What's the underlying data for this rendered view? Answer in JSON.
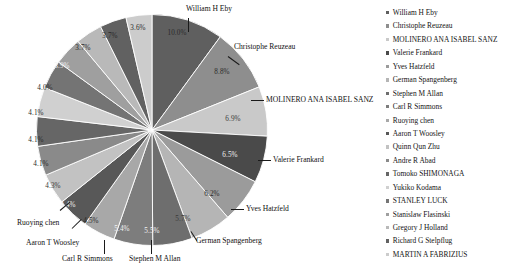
{
  "chart_data": {
    "type": "pie",
    "title": "",
    "legend_position": "right",
    "labels": [
      "William H Eby",
      "Christophe Reuzeau",
      "MOLINERO ANA ISABEL SANZ",
      "Valerie Frankard",
      "Yves Hatzfeld",
      "German Spangenberg",
      "Stephen M Allan",
      "Carl R Simmons",
      "Ruoying chen",
      "Aaron T Woosley",
      "Quinn Qun Zhu",
      "Andre R Abad",
      "Tomoko SHIMONAGA",
      "Yukiko Kodama",
      "STANLEY LUCK",
      "Stanislaw Flasinski",
      "Gregory J Holland",
      "Richard G Stelpflug",
      "MARTIN A FABRIZIUS"
    ],
    "values": [
      10.0,
      8.8,
      6.9,
      6.5,
      6.2,
      5.7,
      5.5,
      5.4,
      4.5,
      4.4,
      4.3,
      4.1,
      4.1,
      4.1,
      4.0,
      3.9,
      3.7,
      3.7,
      3.6
    ],
    "value_labels": [
      "10.0%",
      "8.8%",
      "6.9%",
      "6.5%",
      "6.2%",
      "5.7%",
      "5.5%",
      "5.4%",
      "4.5%",
      "4.4%",
      "4.3%",
      "4.1%",
      "4.1%",
      "4.1%",
      "4.0%",
      "3.9%",
      "3.7%",
      "3.7%",
      "3.6%"
    ],
    "colors": [
      "#5f5f5f",
      "#8e8e8e",
      "#c9c9c9",
      "#4a4a4a",
      "#9b9b9b",
      "#b5b5b5",
      "#6e6e6e",
      "#7d7d7d",
      "#a8a8a8",
      "#585858",
      "#c2c2c2",
      "#8a8a8a",
      "#666666",
      "#d0d0d0",
      "#747474",
      "#9f9f9f",
      "#b9b9b9",
      "#616161",
      "#cccccc"
    ],
    "callouts": [
      "William H Eby",
      "Christophe Reuzeau",
      "MOLINERO ANA ISABEL SANZ",
      "Valerie Frankard",
      "Yves Hatzfeld",
      "German Spangenberg",
      "Stephen M Allan",
      "Carl R Simmons",
      "Aaron T Woosley",
      "Ruoying chen"
    ]
  },
  "legend": {
    "items": [
      {
        "label": "William H Eby",
        "color": "#5f5f5f"
      },
      {
        "label": "Christophe Reuzeau",
        "color": "#8e8e8e"
      },
      {
        "label": "MOLINERO ANA ISABEL SANZ",
        "color": "#c9c9c9"
      },
      {
        "label": "Valerie Frankard",
        "color": "#4a4a4a"
      },
      {
        "label": "Yves Hatzfeld",
        "color": "#9b9b9b"
      },
      {
        "label": "German Spangenberg",
        "color": "#b5b5b5"
      },
      {
        "label": "Stephen M Allan",
        "color": "#6e6e6e"
      },
      {
        "label": "Carl R Simmons",
        "color": "#7d7d7d"
      },
      {
        "label": "Ruoying chen",
        "color": "#a8a8a8"
      },
      {
        "label": "Aaron T Woosley",
        "color": "#585858"
      },
      {
        "label": "Quinn Qun Zhu",
        "color": "#c2c2c2"
      },
      {
        "label": "Andre R Abad",
        "color": "#8a8a8a"
      },
      {
        "label": "Tomoko SHIMONAGA",
        "color": "#666666"
      },
      {
        "label": "Yukiko Kodama",
        "color": "#d0d0d0"
      },
      {
        "label": "STANLEY LUCK",
        "color": "#747474"
      },
      {
        "label": "Stanislaw Flasinski",
        "color": "#9f9f9f"
      },
      {
        "label": "Gregory J Holland",
        "color": "#b9b9b9"
      },
      {
        "label": "Richard G Stelpflug",
        "color": "#616161"
      },
      {
        "label": "MARTIN A FABRIZIUS",
        "color": "#cccccc"
      }
    ]
  },
  "pie_labels": {
    "p0": {
      "text": "10.0%",
      "x": 177,
      "y": 33,
      "tone": "light"
    },
    "p1": {
      "text": "8.8%",
      "x": 222,
      "y": 72,
      "tone": "dark"
    },
    "p2": {
      "text": "6.9%",
      "x": 233,
      "y": 119,
      "tone": "mid"
    },
    "p3": {
      "text": "6.5%",
      "x": 230,
      "y": 155,
      "tone": "light"
    },
    "p4": {
      "text": "6.2%",
      "x": 212,
      "y": 194,
      "tone": "dark"
    },
    "p5": {
      "text": "5.7%",
      "x": 183,
      "y": 219,
      "tone": "mid"
    },
    "p6": {
      "text": "5.5%",
      "x": 152,
      "y": 231,
      "tone": "light"
    },
    "p7": {
      "text": "5.4%",
      "x": 122,
      "y": 229,
      "tone": "light"
    },
    "p8": {
      "text": "4.5%",
      "x": 91,
      "y": 221,
      "tone": "dark"
    },
    "p9": {
      "text": "4.4%",
      "x": 68,
      "y": 205,
      "tone": "light"
    },
    "p10": {
      "text": "4.3%",
      "x": 53,
      "y": 186,
      "tone": "mid"
    },
    "p11": {
      "text": "4.1%",
      "x": 41,
      "y": 164,
      "tone": "dark"
    },
    "p12": {
      "text": "4.1%",
      "x": 36,
      "y": 140,
      "tone": "dark"
    },
    "p13": {
      "text": "4.1%",
      "x": 36,
      "y": 113,
      "tone": "dark"
    },
    "p14": {
      "text": "4.0%",
      "x": 45,
      "y": 88,
      "tone": "dark"
    },
    "p15": {
      "text": "3.9%",
      "x": 62,
      "y": 66,
      "tone": "light"
    },
    "p16": {
      "text": "3.7%",
      "x": 83,
      "y": 48,
      "tone": "dark"
    },
    "p17": {
      "text": "3.7%",
      "x": 110,
      "y": 36,
      "tone": "dark"
    },
    "p18": {
      "text": "3.6%",
      "x": 138,
      "y": 28,
      "tone": "dark"
    }
  },
  "callout_labels": {
    "c0": {
      "text": "William H Eby",
      "x": 186,
      "y": 10
    },
    "c1": {
      "text": "Christophe Reuzeau",
      "x": 234,
      "y": 48
    },
    "c2": {
      "text": "MOLINERO ANA ISABEL SANZ",
      "x": 266,
      "y": 96
    },
    "c3": {
      "text": "Valerie Frankard",
      "x": 273,
      "y": 156
    },
    "c4": {
      "text": "Yves Hatzfeld",
      "x": 246,
      "y": 205
    },
    "c5": {
      "text": "German Spangenberg",
      "x": 196,
      "y": 240
    },
    "c6": {
      "text": "Stephen M Allan",
      "x": 130,
      "y": 258
    },
    "c7": {
      "text": "Carl R Simmons",
      "x": 63,
      "y": 258
    },
    "c8": {
      "text": "Aaron T Woosley",
      "x": 27,
      "y": 242
    },
    "c9": {
      "text": "Ruoying chen",
      "x": 18,
      "y": 222
    }
  }
}
